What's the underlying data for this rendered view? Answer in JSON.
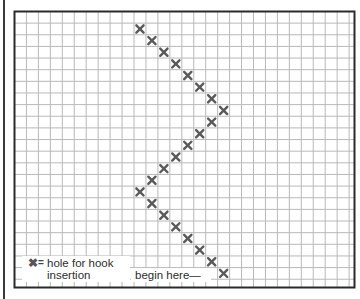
{
  "diagram": {
    "type": "grid-pattern",
    "grid": {
      "left": 14.5,
      "top": 11.5,
      "right": 354.5,
      "bottom": 287.5,
      "cell_w": 11.95,
      "cell_h": 11.64,
      "line_color": "#b9b9b9",
      "border_color": "#2a2a2a"
    },
    "mark_color": "#5a5a5a",
    "marks": [
      {
        "row": 1,
        "col": 10
      },
      {
        "row": 2,
        "col": 11
      },
      {
        "row": 3,
        "col": 12
      },
      {
        "row": 4,
        "col": 13
      },
      {
        "row": 5,
        "col": 14
      },
      {
        "row": 6,
        "col": 15
      },
      {
        "row": 7,
        "col": 16
      },
      {
        "row": 8,
        "col": 17
      },
      {
        "row": 9,
        "col": 16
      },
      {
        "row": 10,
        "col": 15
      },
      {
        "row": 11,
        "col": 14
      },
      {
        "row": 12,
        "col": 13
      },
      {
        "row": 13,
        "col": 12
      },
      {
        "row": 14,
        "col": 11
      },
      {
        "row": 15,
        "col": 10
      },
      {
        "row": 16,
        "col": 11
      },
      {
        "row": 17,
        "col": 12
      },
      {
        "row": 18,
        "col": 13
      },
      {
        "row": 19,
        "col": 14
      },
      {
        "row": 20,
        "col": 15
      },
      {
        "row": 21,
        "col": 16
      },
      {
        "row": 22,
        "col": 17
      }
    ]
  },
  "legend": {
    "symbol": "✖",
    "equals": "=",
    "line1": "hole for hook",
    "line2": "insertion"
  },
  "start_label": "begin here—"
}
